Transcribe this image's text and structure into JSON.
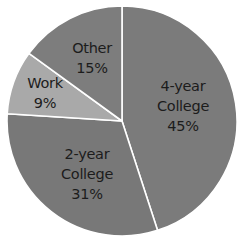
{
  "chart_data": {
    "type": "pie",
    "title": "",
    "start_angle_deg": 0,
    "direction": "clockwise",
    "categories": [
      "4-year College",
      "2-year College",
      "Work",
      "Other"
    ],
    "values": [
      45,
      31,
      9,
      15
    ],
    "unit": "%",
    "colors": [
      "#7b7b7b",
      "#787878",
      "#a9a9a9",
      "#7d7d7d"
    ],
    "separator_color": "#ffffff",
    "legend": "none",
    "labels": [
      {
        "line1": "4-year",
        "line2": "College",
        "pct": "45%"
      },
      {
        "line1": "2-year",
        "line2": "College",
        "pct": "31%"
      },
      {
        "line1": "Work",
        "line2": "",
        "pct": "9%"
      },
      {
        "line1": "Other",
        "line2": "",
        "pct": "15%"
      }
    ]
  }
}
